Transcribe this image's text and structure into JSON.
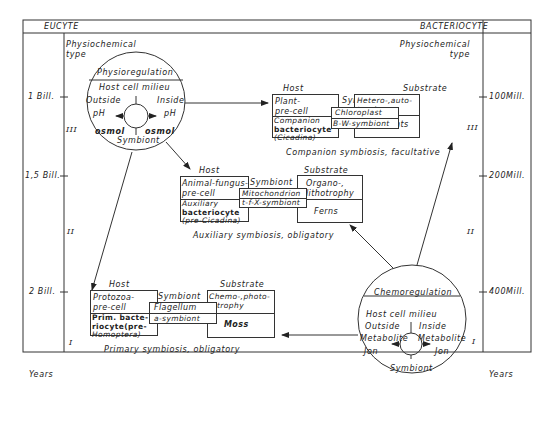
{
  "header": {
    "left_label": "EUCYTE",
    "right_label": "BACTERIOCYTE"
  },
  "left_axis": {
    "ticks": [
      {
        "label": "1 Bill.",
        "y": 97
      },
      {
        "label": "1,5 Bill.",
        "y": 176
      },
      {
        "label": "2 Bill.",
        "y": 292
      }
    ],
    "unit": "Years",
    "eras": [
      "III",
      "II",
      "I"
    ]
  },
  "right_axis": {
    "ticks": [
      {
        "label": "100Mill.",
        "y": 97
      },
      {
        "label": "200Mill.",
        "y": 176
      },
      {
        "label": "400Mill.",
        "y": 292
      }
    ],
    "unit": "Years",
    "eras": [
      "III",
      "II",
      "I"
    ]
  },
  "physiochemical_type_left": [
    "Physiochemical",
    "type"
  ],
  "physiochemical_type_right": [
    "Physiochemical",
    "type"
  ],
  "physioregulation_circle": {
    "title": "Physioregulation",
    "milieu": "Host cell milieu",
    "outside": "Outside",
    "inside": "Inside",
    "left_value": "pH",
    "right_value": "pH",
    "left_value2": "osmol",
    "right_value2": "osmol",
    "bottom": "Symbiont"
  },
  "chemoregulation_circle": {
    "title": "Chemoregulation",
    "milieu": "Host cell milieu",
    "outside": "Outside",
    "inside": "Inside",
    "left_value": "Metabolite",
    "right_value": "Metabolite",
    "left_value2": "Jon",
    "right_value2": "Jon",
    "bottom": "Symbiont"
  },
  "companion": {
    "host_label": "Host",
    "substrate_label": "Substrate",
    "symbiont_label": "Symbiont",
    "host_cell": [
      "Plant-",
      "pre-cell"
    ],
    "bacteriocyte": [
      "Companion",
      "bacteriocyte",
      "(Cicadina)"
    ],
    "symbiont_1": "Chloroplast",
    "symbiont_2": "B-W-symbiont",
    "substrate_1": [
      "Hetero-,auto-",
      "trophy"
    ],
    "substrate_2": "Seed plants",
    "caption": "Companion symbiosis, facultative"
  },
  "auxiliary": {
    "host_label": "Host",
    "substrate_label": "Substrate",
    "symbiont_label": "Symbiont",
    "host_cell": [
      "Animal-fungus-",
      "pre-cell"
    ],
    "bacteriocyte": [
      "Auxiliary",
      "bacteriocyte",
      "(pre-Cicadina)"
    ],
    "symbiont_1": "Mitochondrion",
    "symbiont_2": "t-f-X-symbiont",
    "substrate_1": [
      "Organo-,",
      "lithotrophy"
    ],
    "substrate_2": "Ferns",
    "caption": "Auxiliary symbiosis, obligatory"
  },
  "primary": {
    "host_label": "Host",
    "substrate_label": "Substrate",
    "symbiont_label": "Symbiont",
    "host_cell": [
      "Protozoa-",
      "pre-cell"
    ],
    "bacteriocyte": [
      "Prim. bacte-",
      "riocyte(pre-",
      "Homoptera)"
    ],
    "symbiont_1": "Flagellum",
    "symbiont_2": "a-symbiont",
    "substrate_1": [
      "Chemo-,photo-",
      "trophy"
    ],
    "substrate_2": "Moss",
    "caption": "Primary symbiosis, obligatory"
  }
}
